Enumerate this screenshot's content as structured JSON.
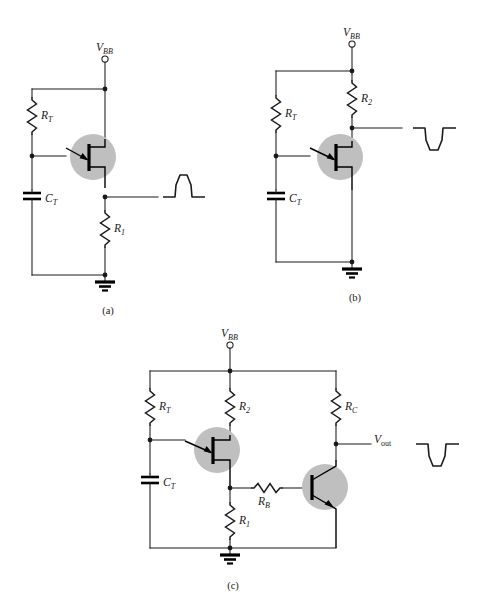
{
  "figure": {
    "background_color": "#ffffff",
    "ink_color": "#1a1a1a",
    "device_halo_color": "#bfbfbf"
  },
  "circuits": [
    {
      "id": "a",
      "caption": "(a)",
      "supply_label": "V",
      "supply_sub": "BB",
      "components": [
        {
          "name": "R_T",
          "base": "R",
          "sub": "T",
          "type": "resistor",
          "orientation": "vertical"
        },
        {
          "name": "C_T",
          "base": "C",
          "sub": "T",
          "type": "capacitor",
          "orientation": "vertical"
        },
        {
          "name": "R_1",
          "base": "R",
          "sub": "1",
          "type": "resistor",
          "orientation": "vertical"
        },
        {
          "name": "UJT",
          "base": "",
          "sub": "",
          "type": "ujt",
          "orientation": "vertical"
        }
      ],
      "output_waveform": "positive-pulse",
      "output_label": ""
    },
    {
      "id": "b",
      "caption": "(b)",
      "supply_label": "V",
      "supply_sub": "BB",
      "components": [
        {
          "name": "R_T",
          "base": "R",
          "sub": "T",
          "type": "resistor",
          "orientation": "vertical"
        },
        {
          "name": "R_2",
          "base": "R",
          "sub": "2",
          "type": "resistor",
          "orientation": "vertical"
        },
        {
          "name": "C_T",
          "base": "C",
          "sub": "T",
          "type": "capacitor",
          "orientation": "vertical"
        },
        {
          "name": "UJT",
          "base": "",
          "sub": "",
          "type": "ujt",
          "orientation": "vertical"
        }
      ],
      "output_waveform": "negative-pulse",
      "output_label": ""
    },
    {
      "id": "c",
      "caption": "(c)",
      "supply_label": "V",
      "supply_sub": "BB",
      "components": [
        {
          "name": "R_T",
          "base": "R",
          "sub": "T",
          "type": "resistor",
          "orientation": "vertical"
        },
        {
          "name": "R_2",
          "base": "R",
          "sub": "2",
          "type": "resistor",
          "orientation": "vertical"
        },
        {
          "name": "R_C",
          "base": "R",
          "sub": "C",
          "type": "resistor",
          "orientation": "vertical"
        },
        {
          "name": "C_T",
          "base": "C",
          "sub": "T",
          "type": "capacitor",
          "orientation": "vertical"
        },
        {
          "name": "R_B",
          "base": "R",
          "sub": "B",
          "type": "resistor",
          "orientation": "horizontal"
        },
        {
          "name": "R_1",
          "base": "R",
          "sub": "1",
          "type": "resistor",
          "orientation": "vertical"
        },
        {
          "name": "UJT",
          "base": "",
          "sub": "",
          "type": "ujt",
          "orientation": "vertical"
        },
        {
          "name": "Q_BJT",
          "base": "",
          "sub": "",
          "type": "npn-bjt",
          "orientation": "vertical"
        }
      ],
      "output_waveform": "negative-pulse",
      "output_label": "V",
      "output_sub": "out"
    }
  ],
  "labels": {
    "vbb_a": {
      "base": "V",
      "sub": "BB"
    },
    "vbb_b": {
      "base": "V",
      "sub": "BB"
    },
    "vbb_c": {
      "base": "V",
      "sub": "BB"
    },
    "rt_a": {
      "base": "R",
      "sub": "T"
    },
    "ct_a": {
      "base": "C",
      "sub": "T"
    },
    "r1_a": {
      "base": "R",
      "sub": "1"
    },
    "rt_b": {
      "base": "R",
      "sub": "T"
    },
    "r2_b": {
      "base": "R",
      "sub": "2"
    },
    "ct_b": {
      "base": "C",
      "sub": "T"
    },
    "rt_c": {
      "base": "R",
      "sub": "T"
    },
    "r2_c": {
      "base": "R",
      "sub": "2"
    },
    "rc_c": {
      "base": "R",
      "sub": "C"
    },
    "ct_c": {
      "base": "C",
      "sub": "T"
    },
    "rb_c": {
      "base": "R",
      "sub": "B"
    },
    "r1_c": {
      "base": "R",
      "sub": "1"
    },
    "vout_c": {
      "base": "V",
      "sub": "out"
    },
    "caption_a": "(a)",
    "caption_b": "(b)",
    "caption_c": "(c)"
  }
}
